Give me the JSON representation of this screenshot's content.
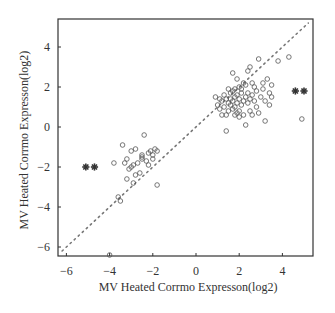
{
  "chart_data": {
    "type": "scatter",
    "title": "",
    "xlabel": "MV Heated Corrmo Expresson(log2)",
    "ylabel": "MV Heated Corrmo Expresson(log2)",
    "xlim": [
      -6.4,
      5.4
    ],
    "ylim": [
      -6.45,
      5.4
    ],
    "xticks": [
      -6,
      -4,
      -2,
      0,
      2,
      4
    ],
    "yticks": [
      -6,
      -4,
      -2,
      0,
      2,
      4
    ],
    "grid": false,
    "legend": null,
    "reference_line": {
      "type": "y=x",
      "style": "dotted",
      "from": [
        -6.2,
        -6.2
      ],
      "to": [
        5.2,
        5.2
      ]
    },
    "series": [
      {
        "name": "genes",
        "marker": "open-circle",
        "points": [
          [
            -4.0,
            -6.4
          ],
          [
            -3.5,
            -3.7
          ],
          [
            -3.6,
            -3.5
          ],
          [
            -3.8,
            -1.8
          ],
          [
            -3.4,
            -0.9
          ],
          [
            -3.2,
            -1.6
          ],
          [
            -3.1,
            -2.1
          ],
          [
            -3.2,
            -2.6
          ],
          [
            -3.0,
            -1.2
          ],
          [
            -2.9,
            -1.9
          ],
          [
            -2.8,
            -1.1
          ],
          [
            -2.8,
            -2.4
          ],
          [
            -2.7,
            -1.8
          ],
          [
            -2.6,
            -2.3
          ],
          [
            -2.5,
            -1.5
          ],
          [
            -2.5,
            -1.6
          ],
          [
            -2.5,
            -1.4
          ],
          [
            -2.4,
            -0.4
          ],
          [
            -2.3,
            -1.7
          ],
          [
            -2.2,
            -1.9
          ],
          [
            -2.2,
            -1.3
          ],
          [
            -2.1,
            -1.2
          ],
          [
            -2.0,
            -1.4
          ],
          [
            -2.0,
            -1.6
          ],
          [
            -1.9,
            -1.1
          ],
          [
            -1.8,
            -1.2
          ],
          [
            -1.8,
            -2.9
          ],
          [
            -3.3,
            -1.8
          ],
          [
            -3.0,
            -2.0
          ],
          [
            -2.9,
            -2.8
          ],
          [
            0.9,
            1.5
          ],
          [
            1.0,
            1.1
          ],
          [
            1.1,
            0.9
          ],
          [
            1.2,
            1.3
          ],
          [
            1.2,
            0.6
          ],
          [
            1.3,
            1.6
          ],
          [
            1.3,
            1.0
          ],
          [
            1.4,
            0.6
          ],
          [
            1.4,
            1.4
          ],
          [
            1.4,
            -0.2
          ],
          [
            1.5,
            1.2
          ],
          [
            1.5,
            0.8
          ],
          [
            1.6,
            1.7
          ],
          [
            1.6,
            1.1
          ],
          [
            1.6,
            1.4
          ],
          [
            1.7,
            1.8
          ],
          [
            1.7,
            1.3
          ],
          [
            1.7,
            0.9
          ],
          [
            1.7,
            2.7
          ],
          [
            1.8,
            1.5
          ],
          [
            1.8,
            1.0
          ],
          [
            1.8,
            1.9
          ],
          [
            1.8,
            0.6
          ],
          [
            1.9,
            1.2
          ],
          [
            1.9,
            1.6
          ],
          [
            1.9,
            2.4
          ],
          [
            2.0,
            1.4
          ],
          [
            2.0,
            0.8
          ],
          [
            2.0,
            2.0
          ],
          [
            2.0,
            0.5
          ],
          [
            2.1,
            1.7
          ],
          [
            2.1,
            1.1
          ],
          [
            2.1,
            1.9
          ],
          [
            2.2,
            1.3
          ],
          [
            2.2,
            0.6
          ],
          [
            2.3,
            1.5
          ],
          [
            2.3,
            2.1
          ],
          [
            2.3,
            0.1
          ],
          [
            2.4,
            1.2
          ],
          [
            2.4,
            1.7
          ],
          [
            2.4,
            2.8
          ],
          [
            2.5,
            1.4
          ],
          [
            2.5,
            0.8
          ],
          [
            2.5,
            3.0
          ],
          [
            2.6,
            1.6
          ],
          [
            2.6,
            2.2
          ],
          [
            2.6,
            0.6
          ],
          [
            2.7,
            1.3
          ],
          [
            2.8,
            1.8
          ],
          [
            2.8,
            1.0
          ],
          [
            2.9,
            3.4
          ],
          [
            2.9,
            0.7
          ],
          [
            3.0,
            1.5
          ],
          [
            3.1,
            2.2
          ],
          [
            3.1,
            1.9
          ],
          [
            3.2,
            0.3
          ],
          [
            3.2,
            1.3
          ],
          [
            3.3,
            2.4
          ],
          [
            3.4,
            1.7
          ],
          [
            3.4,
            1.1
          ],
          [
            3.5,
            1.5
          ],
          [
            3.5,
            2.1
          ],
          [
            3.8,
            3.3
          ],
          [
            4.3,
            3.5
          ],
          [
            4.9,
            0.4
          ],
          [
            1.5,
            1.9
          ],
          [
            1.9,
            0.7
          ],
          [
            2.2,
            2.2
          ],
          [
            1.1,
            1.4
          ],
          [
            2.7,
            2.0
          ]
        ]
      },
      {
        "name": "highlighted",
        "marker": "filled-star",
        "points": [
          [
            -5.1,
            -2.0
          ],
          [
            -4.7,
            -2.0
          ],
          [
            4.6,
            1.8
          ],
          [
            5.0,
            1.8
          ]
        ]
      }
    ]
  },
  "axes": {
    "x_tick_labels": [
      "−6",
      "−4",
      "−2",
      "0",
      "2",
      "4"
    ],
    "y_tick_labels": [
      "−6",
      "−4",
      "−2",
      "0",
      "2",
      "4"
    ],
    "xlabel": "MV Heated Corrmo Expresson(log2)",
    "ylabel": "MV Heated Corrmo Expresson(log2)"
  },
  "colors": {
    "frame": "#333333",
    "points": "#555555",
    "stars": "#333333",
    "reference_line": "#777777"
  }
}
